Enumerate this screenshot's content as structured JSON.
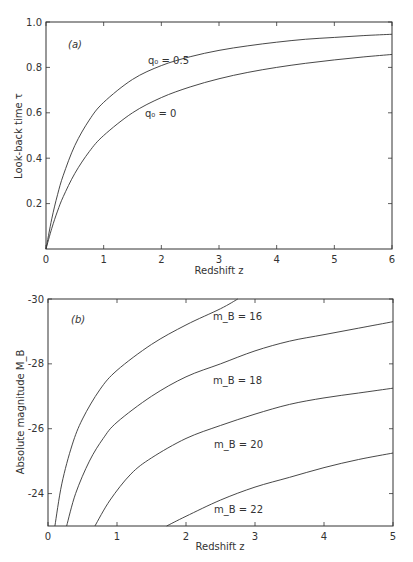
{
  "chart_data": [
    {
      "type": "line",
      "panel": "(a)",
      "xlabel": "Redshift z",
      "ylabel": "Look-back time τ",
      "xlim": [
        0,
        6
      ],
      "ylim": [
        0,
        1.0
      ],
      "xticks": [
        "0",
        "1",
        "2",
        "3",
        "4",
        "5",
        "6"
      ],
      "yticks": [
        "0.2",
        "0.4",
        "0.6",
        "0.8",
        "1.0"
      ],
      "grid": false,
      "x": [
        0,
        0.1,
        0.2,
        0.3,
        0.5,
        0.75,
        1,
        1.5,
        2,
        2.5,
        3,
        3.5,
        4,
        4.5,
        5,
        5.5,
        6
      ],
      "series": [
        {
          "name": "q0=0.5",
          "label": "q₀ = 0.5",
          "values": [
            0,
            0.133,
            0.239,
            0.325,
            0.456,
            0.568,
            0.646,
            0.747,
            0.808,
            0.847,
            0.875,
            0.895,
            0.911,
            0.924,
            0.932,
            0.94,
            0.946
          ]
        },
        {
          "name": "q0=0",
          "label": "q₀ = 0",
          "values": [
            0,
            0.091,
            0.167,
            0.231,
            0.333,
            0.429,
            0.5,
            0.6,
            0.667,
            0.714,
            0.75,
            0.778,
            0.8,
            0.818,
            0.833,
            0.846,
            0.857
          ]
        }
      ]
    },
    {
      "type": "line",
      "panel": "(b)",
      "xlabel": "Redshift z",
      "ylabel": "Absolute magnitude M_B",
      "xlim": [
        0,
        5
      ],
      "ylim": [
        -23,
        -30
      ],
      "xticks": [
        "0",
        "1",
        "2",
        "3",
        "4",
        "5"
      ],
      "yticks": [
        "-24",
        "-26",
        "-28",
        "-30"
      ],
      "grid": false,
      "series": [
        {
          "name": "mB=16",
          "label": "m_B = 16",
          "x": [
            0.1,
            0.2,
            0.35,
            0.5,
            0.75,
            1.0,
            1.5,
            2.0,
            2.5,
            2.75
          ],
          "values": [
            -23.0,
            -24.3,
            -25.5,
            -26.3,
            -27.2,
            -27.8,
            -28.6,
            -29.2,
            -29.7,
            -30.0
          ]
        },
        {
          "name": "mB=18",
          "label": "m_B = 18",
          "x": [
            0.27,
            0.4,
            0.6,
            0.8,
            1.0,
            1.5,
            2.0,
            2.5,
            3.0,
            3.5,
            4.0,
            4.5,
            5.0
          ],
          "values": [
            -23.0,
            -24.0,
            -25.0,
            -25.7,
            -26.2,
            -27.0,
            -27.6,
            -28.0,
            -28.4,
            -28.7,
            -28.9,
            -29.1,
            -29.3
          ]
        },
        {
          "name": "mB=20",
          "label": "m_B = 20",
          "x": [
            0.68,
            0.9,
            1.2,
            1.5,
            2.0,
            2.5,
            3.0,
            3.5,
            4.0,
            4.5,
            5.0
          ],
          "values": [
            -23.0,
            -23.8,
            -24.6,
            -25.1,
            -25.7,
            -26.1,
            -26.45,
            -26.75,
            -26.95,
            -27.1,
            -27.25
          ]
        },
        {
          "name": "mB=22",
          "label": "m_B = 22",
          "x": [
            1.72,
            2.0,
            2.5,
            3.0,
            3.5,
            4.0,
            4.5,
            5.0
          ],
          "values": [
            -23.0,
            -23.3,
            -23.8,
            -24.2,
            -24.5,
            -24.8,
            -25.05,
            -25.25
          ]
        }
      ]
    }
  ],
  "panel_a": {
    "tag": "(a)",
    "xlabel": "Redshift z",
    "ylabel": "Look-back time τ",
    "yticks": [
      "0.2",
      "0.4",
      "0.6",
      "0.8",
      "1.0"
    ],
    "xticks": [
      "0",
      "1",
      "2",
      "3",
      "4",
      "5",
      "6"
    ],
    "label_q05": "q₀ = 0.5",
    "label_q0": "q₀ = 0"
  },
  "panel_b": {
    "tag": "(b)",
    "xlabel": "Redshift z",
    "ylabel": "Absolute magnitude M_B",
    "yticks": [
      "-24",
      "-26",
      "-28",
      "-30"
    ],
    "xticks": [
      "0",
      "1",
      "2",
      "3",
      "4",
      "5"
    ],
    "label_16": "m_B = 16",
    "label_18": "m_B = 18",
    "label_20": "m_B = 20",
    "label_22": "m_B = 22"
  }
}
